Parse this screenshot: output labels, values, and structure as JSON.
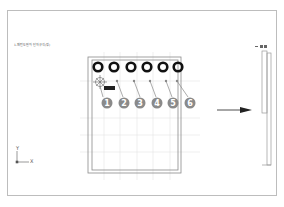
{
  "drawing": {
    "title": "1-패턴도면와 단자규격(정)",
    "badges": [
      "1",
      "2",
      "3",
      "4",
      "5",
      "6"
    ],
    "tag_label": "■■■",
    "axis": {
      "x": "X",
      "y": "Y"
    },
    "side_header": "— ■ ■"
  },
  "colors": {
    "circle": "#111111",
    "badge": "#8a8a8a",
    "grid": "#d8d8d8",
    "line": "#9a9a9a",
    "frame": "#bdbdbd"
  }
}
